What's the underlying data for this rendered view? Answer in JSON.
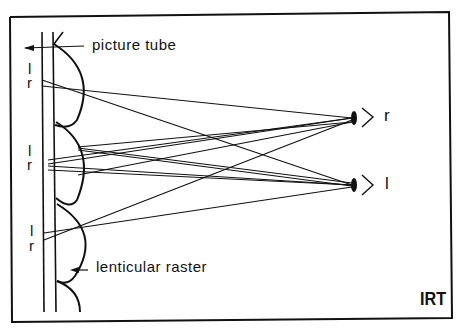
{
  "diagram": {
    "labels": {
      "picture_tube": "picture tube",
      "lenticular_raster": "lenticular raster",
      "logo": "IRT",
      "eye_right": "r",
      "eye_left": "l"
    },
    "pixel_pairs": [
      {
        "l": "l",
        "r": "r"
      },
      {
        "l": "l",
        "r": "r"
      },
      {
        "l": "l",
        "r": "r"
      }
    ],
    "colors": {
      "line": "#111111",
      "background": "#ffffff"
    }
  }
}
